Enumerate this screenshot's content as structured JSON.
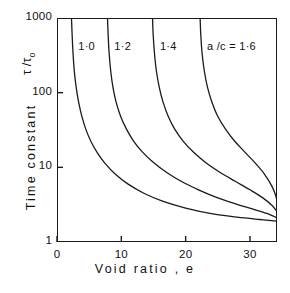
{
  "chart_data": {
    "type": "line",
    "title": "",
    "xlabel": "Void ratio , e",
    "ylabel": "Time constant",
    "y_symbol": "τ /τ",
    "y_symbol_sub": "o",
    "xlim": [
      0,
      34.2
    ],
    "ylim": [
      1,
      1000
    ],
    "yscale": "log",
    "xscale": "linear",
    "grid": false,
    "legend": "inline-curve-labels",
    "xticks": [
      "0",
      "10",
      "20",
      "30"
    ],
    "xtick_values": [
      0,
      10,
      20,
      30
    ],
    "yticks": [
      "1000",
      "100",
      "10",
      "1"
    ],
    "ytick_values": [
      1000,
      100,
      10,
      1
    ],
    "series": [
      {
        "name": "1·0",
        "label": "1·0",
        "label_x": 3.3,
        "asymptote_e": 2.2,
        "end_value": 1.9,
        "points": [
          [
            2.25,
            1000
          ],
          [
            2.35,
            600
          ],
          [
            2.5,
            330
          ],
          [
            2.7,
            190
          ],
          [
            3.0,
            115
          ],
          [
            3.4,
            72
          ],
          [
            3.9,
            47
          ],
          [
            4.5,
            32
          ],
          [
            5.3,
            22
          ],
          [
            6.3,
            15.5
          ],
          [
            7.5,
            11.2
          ],
          [
            9.0,
            8.2
          ],
          [
            11.0,
            6.0
          ],
          [
            13.5,
            4.5
          ],
          [
            16.5,
            3.5
          ],
          [
            20.0,
            2.85
          ],
          [
            24.0,
            2.4
          ],
          [
            28.0,
            2.15
          ],
          [
            31.5,
            2.0
          ],
          [
            34.2,
            1.9
          ]
        ]
      },
      {
        "name": "1·2",
        "label": "1·2",
        "label_x": 8.9,
        "asymptote_e": 7.8,
        "end_value": 2.1,
        "points": [
          [
            7.85,
            1000
          ],
          [
            7.95,
            600
          ],
          [
            8.1,
            340
          ],
          [
            8.35,
            195
          ],
          [
            8.7,
            118
          ],
          [
            9.2,
            74
          ],
          [
            9.9,
            48
          ],
          [
            10.8,
            32.5
          ],
          [
            11.9,
            22.5
          ],
          [
            13.3,
            16.0
          ],
          [
            15.0,
            11.6
          ],
          [
            17.0,
            8.6
          ],
          [
            19.3,
            6.5
          ],
          [
            22.0,
            5.0
          ],
          [
            25.0,
            3.9
          ],
          [
            28.0,
            3.2
          ],
          [
            30.8,
            2.7
          ],
          [
            33.0,
            2.35
          ],
          [
            34.2,
            2.1
          ]
        ]
      },
      {
        "name": "1·4",
        "label": "1·4",
        "label_x": 16.0,
        "asymptote_e": 14.8,
        "end_value": 2.55,
        "points": [
          [
            14.85,
            1000
          ],
          [
            14.95,
            600
          ],
          [
            15.15,
            340
          ],
          [
            15.45,
            195
          ],
          [
            15.9,
            118
          ],
          [
            16.5,
            74
          ],
          [
            17.3,
            48
          ],
          [
            18.3,
            32.5
          ],
          [
            19.6,
            22.5
          ],
          [
            21.2,
            16.0
          ],
          [
            23.1,
            11.6
          ],
          [
            25.3,
            8.6
          ],
          [
            27.7,
            6.5
          ],
          [
            30.0,
            5.0
          ],
          [
            32.0,
            3.9
          ],
          [
            33.4,
            3.1
          ],
          [
            34.2,
            2.55
          ]
        ]
      },
      {
        "name": "a /c = 1·6",
        "label": "a /c = 1·6",
        "label_x": 23.3,
        "asymptote_e": 22.2,
        "end_value": 3.45,
        "points": [
          [
            22.25,
            1000
          ],
          [
            22.35,
            600
          ],
          [
            22.55,
            340
          ],
          [
            22.9,
            195
          ],
          [
            23.4,
            118
          ],
          [
            24.1,
            74
          ],
          [
            25.0,
            48
          ],
          [
            26.2,
            32.5
          ],
          [
            27.6,
            22.5
          ],
          [
            29.2,
            16.0
          ],
          [
            30.9,
            11.2
          ],
          [
            32.3,
            8.0
          ],
          [
            33.4,
            5.6
          ],
          [
            34.0,
            4.2
          ],
          [
            34.2,
            3.45
          ]
        ]
      }
    ]
  },
  "axes": {
    "x_title": "Void ratio , e",
    "y_title": "Time constant",
    "y_symbol_main": "τ /τ",
    "y_symbol_sub": "o"
  },
  "colors": {
    "axis": "#1a1a1a",
    "curve": "#1a1a1a",
    "background": "#ffffff",
    "text": "#111111"
  }
}
